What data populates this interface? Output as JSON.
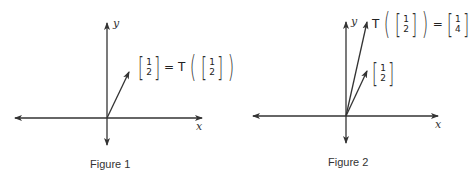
{
  "figures": [
    {
      "caption": "Figure 1",
      "x_axis_label": "x",
      "y_axis_label": "y",
      "vectors": [
        {
          "x": 1,
          "y": 2
        }
      ],
      "label": {
        "lhs_vector": [
          "1",
          "2"
        ],
        "equals": "=",
        "operator": "T",
        "rhs_vector": [
          "1",
          "2"
        ]
      }
    },
    {
      "caption": "Figure 2",
      "x_axis_label": "x",
      "y_axis_label": "y",
      "vectors": [
        {
          "x": 1,
          "y": 2
        },
        {
          "x": 1,
          "y": 4
        }
      ],
      "label_transformed": {
        "operator": "T",
        "input_vector": [
          "1",
          "2"
        ],
        "equals": "=",
        "output_vector": [
          "1",
          "4"
        ]
      },
      "label_original": {
        "vector": [
          "1",
          "2"
        ]
      }
    }
  ],
  "colors": {
    "stroke": "#333333",
    "background": "#ffffff"
  }
}
